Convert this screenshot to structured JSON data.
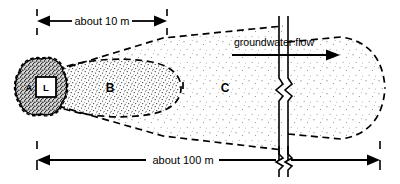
{
  "figure": {
    "background_color": "#ffffff",
    "line_color": "#000000"
  },
  "dimensions": {
    "near": {
      "label": "about 10 m",
      "position": "top",
      "arrow_style": "outward-double-arrow",
      "x_start": 37,
      "x_end": 167
    },
    "far": {
      "label": "about 100 m",
      "position": "bottom",
      "arrow_style": "outward-double-arrow",
      "has_break_symbol": true,
      "x_start": 37,
      "x_end": 380
    }
  },
  "flow": {
    "label": "groundwater flow",
    "direction": "right",
    "arrow_x_start": 232,
    "arrow_x_end": 330,
    "arrow_y": 55
  },
  "source": {
    "label_a": "A",
    "label_l": "L",
    "description": "source zone blob with A and boxed L"
  },
  "zones": [
    {
      "id": "zone-b",
      "label": "B",
      "stipple": "dense",
      "cx": 110,
      "cy": 88
    },
    {
      "id": "zone-c",
      "label": "C",
      "stipple": "sparse",
      "cx": 225,
      "cy": 88
    }
  ],
  "break_line": {
    "name": "vertical-break-symbol",
    "x": 283,
    "description": "double vertical line with zigzag breaks"
  }
}
